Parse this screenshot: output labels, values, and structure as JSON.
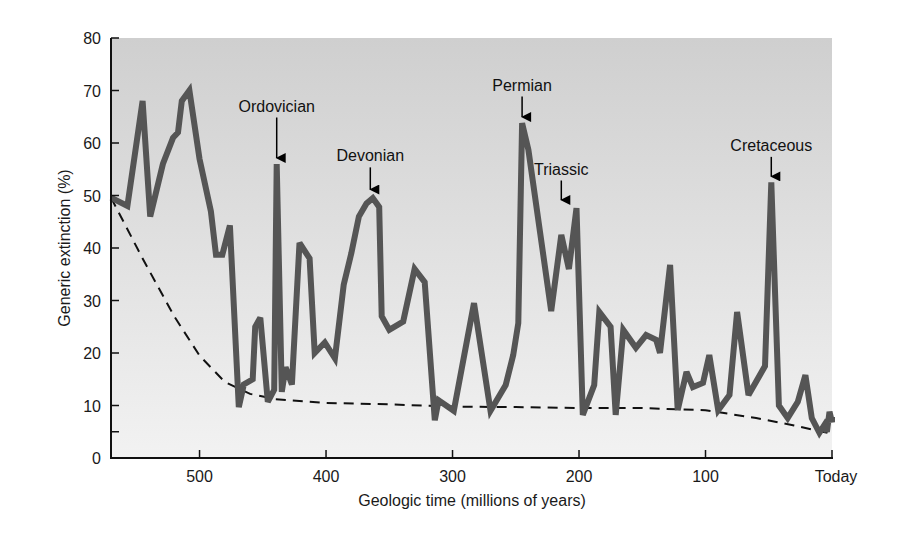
{
  "chart_data": {
    "type": "line",
    "title": "",
    "xlabel": "Geologic time (millions of years)",
    "ylabel": "Generic extinction (%)",
    "xlim": [
      570,
      0
    ],
    "ylim": [
      0,
      80
    ],
    "x_ticks": [
      {
        "value": 500,
        "label": "500"
      },
      {
        "value": 400,
        "label": "400"
      },
      {
        "value": 300,
        "label": "300"
      },
      {
        "value": 200,
        "label": "200"
      },
      {
        "value": 100,
        "label": "100"
      },
      {
        "value": 0,
        "label": "Today"
      }
    ],
    "y_ticks": [
      0,
      10,
      20,
      30,
      40,
      50,
      60,
      70,
      80
    ],
    "y_minor_ticks": [
      5
    ],
    "grid": false,
    "background_gradient": {
      "top": "#cfcfcf",
      "bottom": "#f2f2f2"
    },
    "series": [
      {
        "name": "Generic extinction",
        "style": "solid",
        "color": "#555555",
        "points": [
          [
            570,
            49.6
          ],
          [
            557,
            48
          ],
          [
            545,
            68
          ],
          [
            539,
            46
          ],
          [
            529,
            56
          ],
          [
            521,
            61
          ],
          [
            517,
            62
          ],
          [
            514,
            68
          ],
          [
            508,
            70
          ],
          [
            500,
            57
          ],
          [
            491,
            47
          ],
          [
            487,
            38.7
          ],
          [
            482,
            38.7
          ],
          [
            476,
            44.3
          ],
          [
            469,
            9.7
          ],
          [
            465,
            14
          ],
          [
            458,
            15
          ],
          [
            456,
            25
          ],
          [
            452,
            26.7
          ],
          [
            446,
            10.7
          ],
          [
            441,
            13
          ],
          [
            439,
            56
          ],
          [
            435,
            12.6
          ],
          [
            432,
            17.3
          ],
          [
            427,
            14
          ],
          [
            421,
            41
          ],
          [
            413,
            38
          ],
          [
            409,
            20
          ],
          [
            401,
            22
          ],
          [
            393,
            19
          ],
          [
            386,
            33
          ],
          [
            380,
            39
          ],
          [
            374,
            46
          ],
          [
            368,
            48.5
          ],
          [
            363,
            49.5
          ],
          [
            358,
            47.8
          ],
          [
            356,
            27
          ],
          [
            350,
            24.4
          ],
          [
            339,
            26
          ],
          [
            330,
            36
          ],
          [
            322,
            33.5
          ],
          [
            314,
            7.2
          ],
          [
            311,
            11
          ],
          [
            299,
            9
          ],
          [
            283,
            29.5
          ],
          [
            270,
            9
          ],
          [
            258,
            13.9
          ],
          [
            252,
            19.6
          ],
          [
            248,
            25.7
          ],
          [
            245,
            63.8
          ],
          [
            240,
            58.7
          ],
          [
            222,
            28
          ],
          [
            214,
            42.5
          ],
          [
            208,
            36
          ],
          [
            202,
            47.6
          ],
          [
            197,
            8.2
          ],
          [
            188,
            13.9
          ],
          [
            184,
            27.8
          ],
          [
            175,
            25
          ],
          [
            171,
            8.2
          ],
          [
            165,
            24.4
          ],
          [
            155,
            21
          ],
          [
            147,
            23.4
          ],
          [
            139,
            22.5
          ],
          [
            136,
            20
          ],
          [
            128,
            36.8
          ],
          [
            122,
            9.1
          ],
          [
            115,
            16.4
          ],
          [
            110,
            13.5
          ],
          [
            102,
            14.3
          ],
          [
            97,
            19.6
          ],
          [
            90,
            9.1
          ],
          [
            81,
            12
          ],
          [
            75,
            27.8
          ],
          [
            66,
            12
          ],
          [
            53,
            17.5
          ],
          [
            48,
            52.5
          ],
          [
            42,
            10
          ],
          [
            35,
            7.6
          ],
          [
            27,
            10.7
          ],
          [
            21,
            15.8
          ],
          [
            16,
            7.6
          ],
          [
            10,
            4.8
          ],
          [
            6,
            6.3
          ],
          [
            4,
            5
          ],
          [
            2,
            8.8
          ],
          [
            -1,
            6.8
          ],
          [
            -2,
            7.8
          ]
        ]
      },
      {
        "name": "Background extinction trend",
        "style": "dashed",
        "color": "#111111",
        "points": [
          [
            570,
            49.6
          ],
          [
            545,
            38
          ],
          [
            520,
            27
          ],
          [
            500,
            19.5
          ],
          [
            480,
            14.5
          ],
          [
            460,
            12.2
          ],
          [
            440,
            11.2
          ],
          [
            400,
            10.5
          ],
          [
            350,
            10.2
          ],
          [
            300,
            9.8
          ],
          [
            250,
            9.7
          ],
          [
            200,
            9.5
          ],
          [
            150,
            9.5
          ],
          [
            100,
            9.1
          ],
          [
            60,
            7.6
          ],
          [
            30,
            6.2
          ],
          [
            0,
            4.6
          ]
        ]
      }
    ],
    "annotations": [
      {
        "label": "Ordovician",
        "x": 439,
        "y": 56,
        "label_y": 66
      },
      {
        "label": "Devonian",
        "x": 365,
        "y": 50,
        "label_y": 56.5
      },
      {
        "label": "Permian",
        "x": 245,
        "y": 63.8,
        "label_y": 70
      },
      {
        "label": "Triassic",
        "x": 214,
        "y": 48,
        "label_y": 54
      },
      {
        "label": "Cretaceous",
        "x": 48,
        "y": 52.5,
        "label_y": 58.5
      }
    ]
  }
}
